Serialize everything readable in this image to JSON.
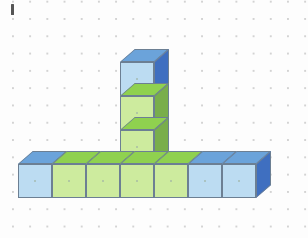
{
  "figure": {
    "label": "I",
    "credit": "Ilustrações: Banco de imagens/Arquivo da editora",
    "background_color": "#fdfdfd",
    "grid": {
      "type": "dot-grid",
      "dot_color": "#b9b9b9",
      "spacing_px": 17
    },
    "palette": {
      "blue_front": "#bcdcf2",
      "blue_top": "#6ba3da",
      "blue_side": "#3f6fc0",
      "green_front": "#cdeb9e",
      "green_top": "#8fd14f",
      "green_side": "#79ae4b",
      "edge": "#6c7f93"
    },
    "totals": {
      "base_row_cubes": 7,
      "column_cubes": 3,
      "total_cubes": 10
    },
    "cubes": [
      {
        "id": "base-1",
        "color": "blue",
        "col": 0,
        "row": 0,
        "x": 18,
        "y": 151
      },
      {
        "id": "base-2",
        "color": "green",
        "col": 1,
        "row": 0,
        "x": 52,
        "y": 151
      },
      {
        "id": "base-3",
        "color": "green",
        "col": 2,
        "row": 0,
        "x": 86,
        "y": 151
      },
      {
        "id": "base-4",
        "color": "green",
        "col": 3,
        "row": 0,
        "x": 120,
        "y": 151
      },
      {
        "id": "base-5",
        "color": "green",
        "col": 4,
        "row": 0,
        "x": 154,
        "y": 151
      },
      {
        "id": "base-6",
        "color": "blue",
        "col": 5,
        "row": 0,
        "x": 188,
        "y": 151
      },
      {
        "id": "base-7",
        "color": "blue",
        "col": 6,
        "row": 0,
        "x": 222,
        "y": 151
      },
      {
        "id": "col-1",
        "color": "green",
        "col": 3,
        "row": 1,
        "x": 120,
        "y": 117
      },
      {
        "id": "col-2",
        "color": "green",
        "col": 3,
        "row": 2,
        "x": 120,
        "y": 83
      },
      {
        "id": "col-3",
        "color": "blue",
        "col": 3,
        "row": 3,
        "x": 120,
        "y": 49
      }
    ]
  }
}
